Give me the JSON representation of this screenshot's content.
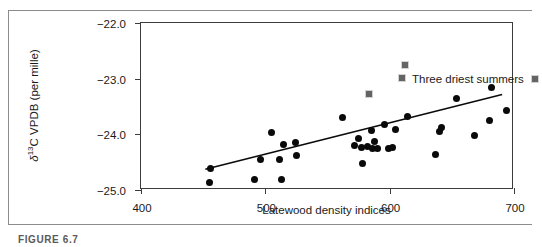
{
  "figure": {
    "caption": "FIGURE 6.7",
    "legend_label": "Three driest summers",
    "legend_marker": "gray-square-marker"
  },
  "showthrough_text": {
    "line1": "reverse-page show-through",
    "line2": "reverse-page show-through",
    "line3": "reverse-page show-through",
    "line4": "reverse-page show-through"
  },
  "colors": {
    "dot": "#0a0a0a",
    "square": "#646464",
    "square_border": "#d2d2d2",
    "axis": "#3c3c3c",
    "frame": "#8c8c8c",
    "text": "#1a1a1a"
  },
  "chart_data": {
    "type": "scatter",
    "title": "",
    "subtitle": "",
    "xlabel": "Latewood density indices",
    "ylabel": "δ¹³C VPDB (per mille)",
    "ylabel_parts": {
      "delta": "δ",
      "sup": "13",
      "rest": "C VPDB (per mille)"
    },
    "xlim": [
      400,
      700
    ],
    "ylim": [
      -25.0,
      -22.0
    ],
    "xticks": [
      400,
      500,
      600,
      700
    ],
    "yticks": [
      -22.0,
      -23.0,
      -24.0,
      -25.0
    ],
    "xtick_labels": [
      "400",
      "500",
      "600",
      "700"
    ],
    "ytick_labels": [
      "−22.0",
      "−23.0",
      "−24.0",
      "−25.0"
    ],
    "grid": false,
    "legend_position": "inside-top-right",
    "annotations": [
      {
        "text": "Three driest summers",
        "marker": "square",
        "x": 612,
        "y": -22.75
      }
    ],
    "series": [
      {
        "name": "Normal summers",
        "marker": "circle",
        "color": "#0a0a0a",
        "points": [
          [
            455,
            -24.86
          ],
          [
            456,
            -24.62
          ],
          [
            491,
            -24.82
          ],
          [
            496,
            -24.46
          ],
          [
            505,
            -23.96
          ],
          [
            511,
            -24.46
          ],
          [
            513,
            -24.82
          ],
          [
            515,
            -24.18
          ],
          [
            524,
            -24.14
          ],
          [
            525,
            -24.38
          ],
          [
            562,
            -23.7
          ],
          [
            572,
            -24.2
          ],
          [
            575,
            -24.08
          ],
          [
            577,
            -24.24
          ],
          [
            578,
            -24.52
          ],
          [
            582,
            -24.22
          ],
          [
            585,
            -23.94
          ],
          [
            586,
            -24.25
          ],
          [
            588,
            -24.12
          ],
          [
            590,
            -24.26
          ],
          [
            596,
            -23.82
          ],
          [
            599,
            -24.26
          ],
          [
            602,
            -24.24
          ],
          [
            605,
            -23.92
          ],
          [
            614,
            -23.68
          ],
          [
            637,
            -24.36
          ],
          [
            640,
            -23.95
          ],
          [
            642,
            -23.88
          ],
          [
            654,
            -23.35
          ],
          [
            668,
            -24.02
          ],
          [
            680,
            -23.76
          ],
          [
            682,
            -23.16
          ],
          [
            694,
            -23.58
          ]
        ]
      },
      {
        "name": "Three driest summers",
        "marker": "square",
        "color": "#646464",
        "points": [
          [
            583,
            -23.28
          ],
          [
            610,
            -22.98
          ],
          [
            612,
            -22.75
          ]
        ]
      }
    ],
    "trendline": {
      "type": "linear",
      "x_start": 452,
      "y_start": -24.66,
      "x_end": 692,
      "y_end": -23.3
    }
  }
}
